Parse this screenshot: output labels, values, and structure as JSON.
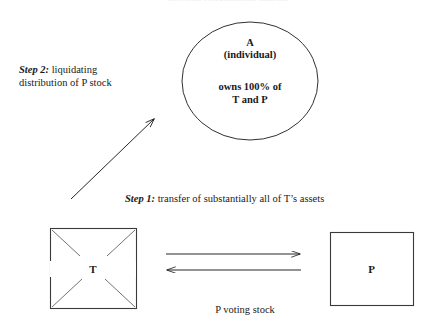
{
  "page": {
    "title_sliver": "corporate reorganization diagram",
    "background_color": "#ffffff",
    "ink_color": "#1a1a1a"
  },
  "entities": {
    "shareholder": {
      "shape": "ellipse",
      "name": "A",
      "descriptor": "(individual)",
      "ownership_line1": "owns 100% of",
      "ownership_line2": "T and P"
    },
    "target": {
      "shape": "square-with-x",
      "label": "T",
      "annotation": "X through box indicates liquidation of T"
    },
    "acquirer": {
      "shape": "square",
      "label": "P"
    }
  },
  "steps": {
    "step1": {
      "lead": "Step 1:",
      "text": " transfer of substantially all of T’s assets"
    },
    "step2": {
      "lead": "Step 2:",
      "line1": " liquidating",
      "line2": "distribution of P stock"
    }
  },
  "arrows": {
    "assets_transfer": {
      "label": "",
      "direction": "T to P"
    },
    "stock_consideration": {
      "label": "P voting stock",
      "direction": "P to T"
    },
    "liquidating_distribution": {
      "direction": "T to A"
    }
  },
  "captions": {
    "consideration": "P voting stock"
  }
}
